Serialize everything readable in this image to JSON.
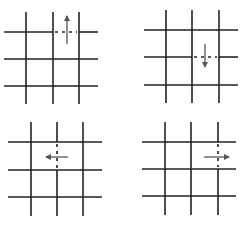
{
  "figure": {
    "stroke_color": "#222222",
    "arrow_color": "#555555",
    "panels": [
      {
        "id": "top-left",
        "direction": "up",
        "vlines": [
          26,
          53,
          79
        ],
        "hlines": [
          32,
          59,
          86
        ],
        "x0": 4,
        "x1": 98,
        "y0": 12,
        "y1": 104,
        "dashed": {
          "orientation": "h",
          "at": 32,
          "from": 55,
          "to": 77
        },
        "arrow": {
          "x1": 67,
          "y1": 44,
          "x2": 67,
          "y2": 16
        }
      },
      {
        "id": "top-right",
        "direction": "down",
        "vlines": [
          166,
          192,
          219
        ],
        "hlines": [
          30,
          57,
          85
        ],
        "x0": 144,
        "x1": 238,
        "y0": 10,
        "y1": 103,
        "dashed": {
          "orientation": "h",
          "at": 57,
          "from": 194,
          "to": 217
        },
        "arrow": {
          "x1": 205,
          "y1": 44,
          "x2": 205,
          "y2": 67
        }
      },
      {
        "id": "bottom-left",
        "direction": "left",
        "vlines": [
          31,
          57,
          83
        ],
        "hlines": [
          142,
          170,
          197
        ],
        "x0": 8,
        "x1": 102,
        "y0": 122,
        "y1": 216,
        "dashed": {
          "orientation": "v",
          "at": 57,
          "from": 144,
          "to": 168
        },
        "arrow": {
          "x1": 68,
          "y1": 157,
          "x2": 46,
          "y2": 157
        }
      },
      {
        "id": "bottom-right",
        "direction": "right",
        "vlines": [
          165,
          191,
          218
        ],
        "hlines": [
          142,
          169,
          196
        ],
        "x0": 142,
        "x1": 236,
        "y0": 122,
        "y1": 215,
        "dashed": {
          "orientation": "v",
          "at": 218,
          "from": 144,
          "to": 167
        },
        "arrow": {
          "x1": 204,
          "y1": 157,
          "x2": 229,
          "y2": 157
        }
      }
    ]
  },
  "caption": {
    "text": ""
  }
}
